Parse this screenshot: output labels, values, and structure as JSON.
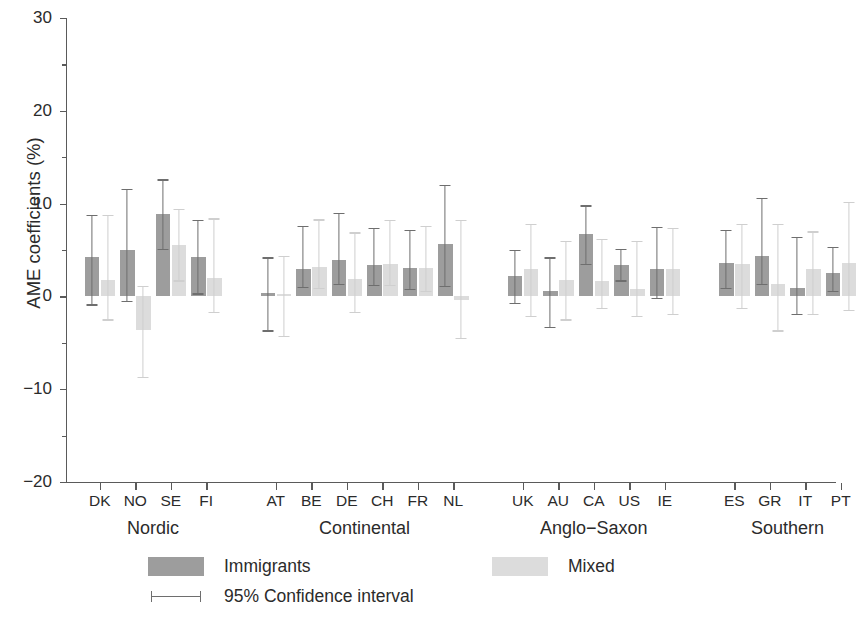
{
  "chart_data": {
    "type": "bar",
    "title": "",
    "xlabel": "",
    "ylabel": "AME coefficients (%)",
    "ylim": [
      -20,
      30
    ],
    "yticks": [
      -20,
      -10,
      0,
      10,
      20,
      30
    ],
    "ytick_labels": [
      "-20",
      "-10",
      "0",
      "10",
      "20",
      "30"
    ],
    "minor_tick_step": 5,
    "grid": false,
    "legend_position": "below",
    "zero_reference": 0,
    "series": [
      {
        "name": "Immigrants",
        "color": "#9d9d9d"
      },
      {
        "name": "Mixed",
        "color": "#dcdcdc"
      }
    ],
    "ci_label": "95% Confidence interval",
    "ci_level": 95,
    "groups": [
      {
        "name": "Nordic",
        "categories": [
          "DK",
          "NO",
          "SE",
          "FI"
        ],
        "immigrants": {
          "values": [
            4.2,
            5.0,
            8.9,
            4.2
          ],
          "ci_low": [
            -1.0,
            -0.6,
            5.0,
            0.2
          ],
          "ci_high": [
            8.8,
            11.6,
            12.6,
            8.2
          ]
        },
        "mixed": {
          "values": [
            1.8,
            -3.6,
            5.5,
            2.0
          ],
          "ci_low": [
            -2.6,
            -8.8,
            1.6,
            -1.8
          ],
          "ci_high": [
            8.8,
            1.1,
            9.4,
            8.4
          ]
        }
      },
      {
        "name": "Continental",
        "categories": [
          "AT",
          "BE",
          "DE",
          "CH",
          "FR",
          "NL"
        ],
        "immigrants": {
          "values": [
            0.4,
            2.9,
            3.9,
            3.4,
            3.1,
            5.6
          ],
          "ci_low": [
            -3.8,
            0.9,
            1.2,
            1.1,
            0.7,
            1.0
          ],
          "ci_high": [
            4.2,
            7.6,
            9.0,
            7.4,
            7.2,
            12.0
          ]
        },
        "mixed": {
          "values": [
            0.3,
            3.2,
            1.9,
            3.5,
            3.1,
            -0.4
          ],
          "ci_low": [
            -4.4,
            0.8,
            -1.8,
            1.1,
            0.5,
            -4.6
          ],
          "ci_high": [
            4.4,
            8.3,
            6.9,
            8.2,
            7.6,
            8.2
          ]
        }
      },
      {
        "name": "Anglo-Saxon",
        "categories": [
          "UK",
          "AU",
          "CA",
          "US",
          "IE"
        ],
        "immigrants": {
          "values": [
            2.2,
            0.6,
            6.7,
            3.4,
            3.0
          ],
          "ci_low": [
            -0.8,
            -3.4,
            3.4,
            1.6,
            -0.3
          ],
          "ci_high": [
            5.0,
            4.2,
            9.8,
            5.1,
            7.5
          ]
        },
        "mixed": {
          "values": [
            3.0,
            1.8,
            1.7,
            0.8,
            3.0
          ],
          "ci_low": [
            -2.2,
            -2.6,
            -1.4,
            -2.2,
            -2.0
          ],
          "ci_high": [
            7.8,
            6.0,
            6.2,
            6.0,
            7.4
          ]
        }
      },
      {
        "name": "Southern",
        "categories": [
          "ES",
          "GR",
          "IT",
          "PT"
        ],
        "immigrants": {
          "values": [
            3.6,
            4.4,
            0.9,
            2.5
          ],
          "ci_low": [
            0.8,
            1.2,
            -2.0,
            0.5
          ],
          "ci_high": [
            7.2,
            10.6,
            6.4,
            5.3
          ]
        },
        "mixed": {
          "values": [
            3.5,
            1.3,
            3.0,
            3.6
          ],
          "ci_low": [
            -1.4,
            -3.8,
            -2.0,
            -1.6
          ],
          "ci_high": [
            7.8,
            7.8,
            7.0,
            10.2
          ]
        }
      }
    ]
  },
  "legend": {
    "immigrants_label": "Immigrants",
    "mixed_label": "Mixed",
    "ci_label": "95% Confidence interval"
  },
  "axes": {
    "y_title": "AME coefficients (%)"
  }
}
